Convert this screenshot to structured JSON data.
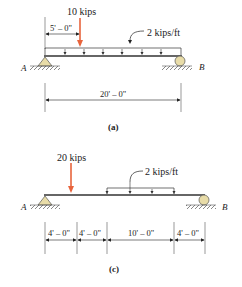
{
  "diagram_a": {
    "point_load": "10 kips",
    "distributed_load": "2 kips/ft",
    "dim_load_position": "5' – 0\"",
    "dim_span": "20' – 0\"",
    "support_left": "A",
    "support_right": "B",
    "caption": "(a)"
  },
  "diagram_c": {
    "point_load": "20 kips",
    "distributed_load": "2 kips/ft",
    "dims": [
      "4' – 0\"",
      "4' – 0\"",
      "10' – 0\"",
      "4' – 0\""
    ],
    "support_left": "A",
    "support_right": "B",
    "caption": "(c)"
  },
  "colors": {
    "load_arrow": "#e8643c",
    "beam": "#333333",
    "support_fill": "#e8dca8"
  }
}
